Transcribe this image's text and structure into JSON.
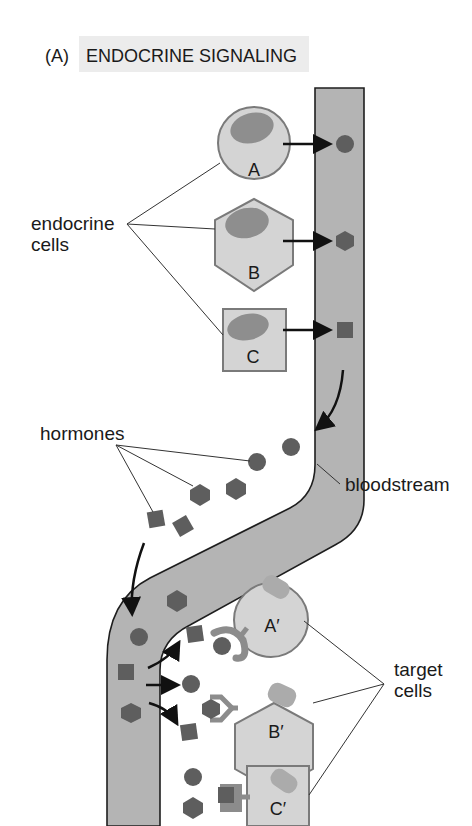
{
  "figure": {
    "panel_label": "(A)",
    "title": "ENDOCRINE SIGNALING",
    "title_highlight": "#ececec"
  },
  "labels": {
    "endocrine_cells_line1": "endocrine",
    "endocrine_cells_line2": "cells",
    "hormones": "hormones",
    "bloodstream": "bloodstream",
    "target_cells_line1": "target",
    "target_cells_line2": "cells"
  },
  "endocrine_cells": [
    {
      "letter": "A",
      "shape": "circle",
      "hormone": "circle"
    },
    {
      "letter": "B",
      "shape": "hexagon",
      "hormone": "hexagon"
    },
    {
      "letter": "C",
      "shape": "square",
      "hormone": "square"
    }
  ],
  "target_cells": [
    {
      "letter": "A′",
      "shape": "circle",
      "receptor_binds": "circle"
    },
    {
      "letter": "B′",
      "shape": "hexagon",
      "receptor_binds": "hexagon"
    },
    {
      "letter": "C′",
      "shape": "square",
      "receptor_binds": "square"
    }
  ],
  "colors": {
    "vessel_fill": "#b4b4b4",
    "vessel_stroke": "#1e1e1e",
    "cell_fill": "#d4d4d4",
    "cell_stroke": "#7a7a7a",
    "nucleus": "#8e8e8e",
    "target_nucleus": "#ababab",
    "hormone": "#5e5e5e",
    "receptor": "#8c8c8c",
    "arrow": "#111111"
  }
}
